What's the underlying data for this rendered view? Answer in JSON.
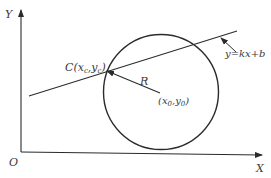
{
  "diagram": {
    "axes": {
      "y_label": "Y",
      "x_label": "X",
      "origin_label": "O"
    },
    "line": {
      "equation_label": "y=kx+b"
    },
    "circle": {
      "radius_label": "R",
      "center_label_parts": {
        "open": "(",
        "x": "x",
        "x_sub": "0",
        "sep": ",",
        "y": "y",
        "y_sub": "0",
        "close": ")"
      }
    },
    "point_c": {
      "label_parts": {
        "name": "C",
        "open": "(",
        "x": "x",
        "x_sub": "c",
        "sep": ",",
        "y": "y",
        "y_sub": "c",
        "close": ")"
      }
    }
  }
}
